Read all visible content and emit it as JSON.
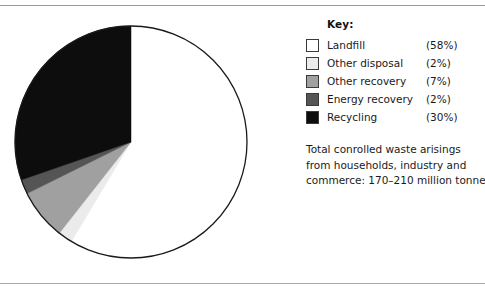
{
  "legend": {
    "title": "Key:",
    "items": [
      {
        "label": "Landfill",
        "percent": "(58%)",
        "color": "#ffffff"
      },
      {
        "label": "Other disposal",
        "percent": "(2%)",
        "color": "#ebebeb"
      },
      {
        "label": "Other recovery",
        "percent": "(7%)",
        "color": "#a0a0a0"
      },
      {
        "label": "Energy recovery",
        "percent": "(2%)",
        "color": "#555555"
      },
      {
        "label": "Recycling",
        "percent": "(30%)",
        "color": "#0d0d0d"
      }
    ]
  },
  "caption": {
    "line1": "Total conrolled waste arisings",
    "line2": "from households, industry and",
    "line3": "commerce: 170–210 million tonnes"
  },
  "chart_data": {
    "type": "pie",
    "title": "",
    "start_angle_deg": 0,
    "direction": "clockwise",
    "total_label": "Total conrolled waste arisings from households, industry and commerce: 170–210 million tonnes",
    "total_range_million_tonnes": [
      170,
      210
    ],
    "units": "percent",
    "legend_position": "right",
    "categories": [
      "Landfill",
      "Other disposal",
      "Other recovery",
      "Energy recovery",
      "Recycling"
    ],
    "values": [
      58,
      2,
      7,
      2,
      30
    ],
    "colors": [
      "#ffffff",
      "#ebebeb",
      "#a0a0a0",
      "#555555",
      "#0d0d0d"
    ],
    "slice_outline_color": "#1a1a1a"
  }
}
